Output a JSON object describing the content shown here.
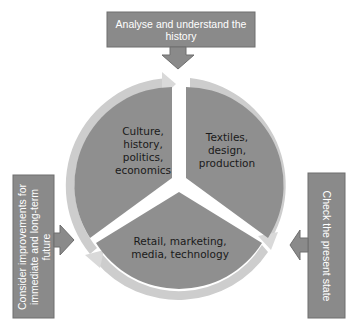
{
  "colors": {
    "box_fill": "#8a8a8a",
    "box_border": "#6e6e6e",
    "segment_fill": "#8f8f8f",
    "ring_fill": "#cdcdcd",
    "background": "#ffffff"
  },
  "steps": {
    "top": "Analyse and understand the history",
    "right": "Check the present state",
    "left": "Consider improvements for immediate and long-term future"
  },
  "segments": {
    "top_left": "Culture,\nhistory,\npolitics,\neconomics",
    "top_right": "Textiles,\ndesign,\nproduction",
    "bottom": "Retail, marketing,\nmedia, technology"
  }
}
